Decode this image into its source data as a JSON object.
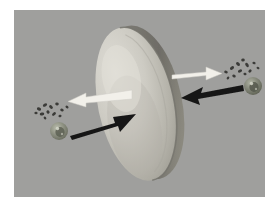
{
  "figure": {
    "title": "Membrane-mediated particle transport diagram",
    "background_color": "#ffffff",
    "panel_color": "#9d9d9d",
    "panel": {
      "x": 14,
      "y": 10,
      "width": 251,
      "height": 187
    }
  },
  "membrane": {
    "label": "membrane-disc",
    "description": "Large tilted elliptical disc seen in perspective",
    "face_color_light": "#d8d6cf",
    "face_color_mid": "#bdbbb2",
    "face_color_shadow": "#9a9890",
    "rim_color": "#7d7b74",
    "rim_highlight": "#b3b1a8",
    "center": {
      "x": 122,
      "y": 94
    },
    "radius_x": 38,
    "radius_y": 78,
    "rotation_deg": -12
  },
  "arrows": [
    {
      "name": "white-arrow-left",
      "direction": "left",
      "color": "#f2f0ea",
      "from": {
        "x": 118,
        "y": 84
      },
      "to": {
        "x": 53,
        "y": 92
      },
      "meaning": "outbound-flux-left"
    },
    {
      "name": "black-arrow-right",
      "direction": "right",
      "color": "#161616",
      "from": {
        "x": 56,
        "y": 123
      },
      "to": {
        "x": 120,
        "y": 104
      },
      "meaning": "inbound-flux-right"
    },
    {
      "name": "white-arrow-right",
      "direction": "right",
      "color": "#f2f0ea",
      "from": {
        "x": 160,
        "y": 68
      },
      "to": {
        "x": 207,
        "y": 63
      },
      "meaning": "outbound-flux-right"
    },
    {
      "name": "black-arrow-left",
      "direction": "left",
      "color": "#161616",
      "from": {
        "x": 228,
        "y": 78
      },
      "to": {
        "x": 168,
        "y": 88
      },
      "meaning": "inbound-flux-left"
    }
  ],
  "particles": {
    "sphere_color_outer": "#8f9283",
    "sphere_color_inner": "#5d6054",
    "sphere_highlight": "#c9cbbd",
    "fragment_color": "#3a3a38",
    "left_sphere": {
      "name": "left-particle-sphere",
      "x": 45,
      "y": 121,
      "r": 9
    },
    "right_sphere": {
      "name": "right-particle-sphere",
      "x": 239,
      "y": 76,
      "r": 9
    },
    "left_fragments": [
      {
        "x": 25,
        "y": 99,
        "w": 4,
        "h": 3,
        "rot": 20
      },
      {
        "x": 31,
        "y": 95,
        "w": 4,
        "h": 3,
        "rot": -30
      },
      {
        "x": 37,
        "y": 97,
        "w": 4,
        "h": 3,
        "rot": 45
      },
      {
        "x": 43,
        "y": 94,
        "w": 3,
        "h": 3,
        "rot": 10
      },
      {
        "x": 28,
        "y": 104,
        "w": 4,
        "h": 3,
        "rot": -15
      },
      {
        "x": 34,
        "y": 102,
        "w": 3,
        "h": 3,
        "rot": 60
      },
      {
        "x": 40,
        "y": 104,
        "w": 4,
        "h": 3,
        "rot": -40
      },
      {
        "x": 48,
        "y": 100,
        "w": 3,
        "h": 3,
        "rot": 25
      },
      {
        "x": 22,
        "y": 103,
        "w": 3,
        "h": 2,
        "rot": 0
      },
      {
        "x": 53,
        "y": 97,
        "w": 3,
        "h": 3,
        "rot": 35
      },
      {
        "x": 46,
        "y": 106,
        "w": 3,
        "h": 2,
        "rot": -20
      },
      {
        "x": 31,
        "y": 108,
        "w": 3,
        "h": 2,
        "rot": 50
      }
    ],
    "right_fragments": [
      {
        "x": 212,
        "y": 62,
        "w": 3,
        "h": 3,
        "rot": 15
      },
      {
        "x": 218,
        "y": 58,
        "w": 4,
        "h": 3,
        "rot": -35
      },
      {
        "x": 224,
        "y": 54,
        "w": 4,
        "h": 3,
        "rot": 40
      },
      {
        "x": 229,
        "y": 50,
        "w": 3,
        "h": 3,
        "rot": -10
      },
      {
        "x": 233,
        "y": 55,
        "w": 4,
        "h": 3,
        "rot": 55
      },
      {
        "x": 226,
        "y": 61,
        "w": 4,
        "h": 3,
        "rot": -25
      },
      {
        "x": 220,
        "y": 66,
        "w": 3,
        "h": 3,
        "rot": 30
      },
      {
        "x": 236,
        "y": 61,
        "w": 3,
        "h": 3,
        "rot": -45
      },
      {
        "x": 231,
        "y": 64,
        "w": 3,
        "h": 2,
        "rot": 20
      },
      {
        "x": 240,
        "y": 53,
        "w": 3,
        "h": 3,
        "rot": 5
      },
      {
        "x": 214,
        "y": 68,
        "w": 3,
        "h": 2,
        "rot": -50
      },
      {
        "x": 244,
        "y": 58,
        "w": 3,
        "h": 2,
        "rot": 25
      }
    ]
  }
}
